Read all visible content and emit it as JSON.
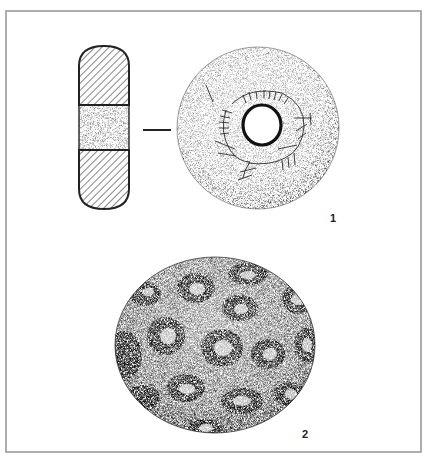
{
  "plate": {
    "background": "#ffffff",
    "frame_color": "#9a9a9a",
    "frame": {
      "left": 6,
      "top": 11,
      "right": 421,
      "bottom": 452
    }
  },
  "figures": [
    {
      "id": 1,
      "label": "1",
      "label_pos": {
        "x": 330,
        "y": 213
      },
      "description": "Perforated disc shown in section and plan view with incised marks around the central hole",
      "section": {
        "x": 78,
        "y": 46,
        "width": 52,
        "height": 163,
        "hatched_top": [
          46,
          105
        ],
        "stippled_band": [
          105,
          150
        ],
        "hatched_bottom": [
          150,
          209
        ]
      },
      "connector_dash": {
        "x1": 143,
        "x2": 171,
        "y": 130
      },
      "disc": {
        "cx": 258,
        "cy": 128,
        "r": 81
      },
      "hole": {
        "cx": 262,
        "cy": 125,
        "rx": 19,
        "ry": 20
      }
    },
    {
      "id": 2,
      "label": "2",
      "label_pos": {
        "x": 302,
        "y": 429
      },
      "description": "Rounded stone with pitted surface showing ring-shaped depressions",
      "sphere": {
        "cx": 215,
        "cy": 345,
        "rx": 100,
        "ry": 88
      }
    }
  ]
}
